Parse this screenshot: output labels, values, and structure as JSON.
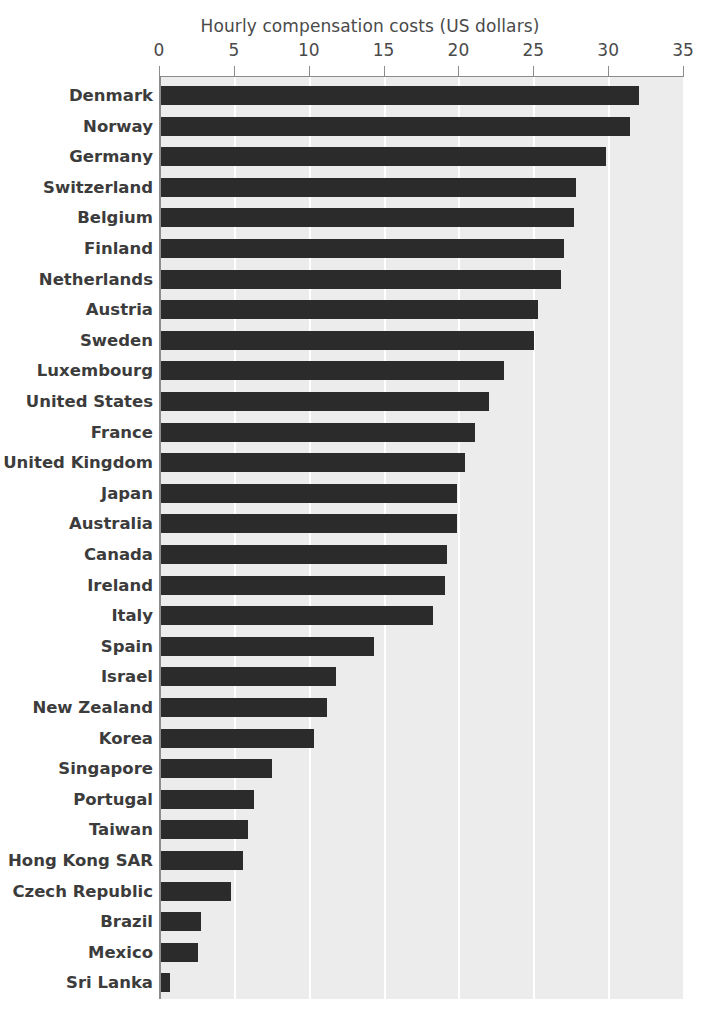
{
  "chart_data": {
    "type": "bar",
    "orientation": "horizontal",
    "title": "Hourly compensation costs (US dollars)",
    "xlabel": "",
    "ylabel": "",
    "xlim": [
      0,
      35
    ],
    "xticks": [
      0,
      5,
      10,
      15,
      20,
      25,
      30,
      35
    ],
    "xtick_labels": [
      "0",
      "5",
      "10",
      "15",
      "20",
      "25",
      "30",
      "35"
    ],
    "grid": true,
    "grid_axis": "x",
    "legend": false,
    "bar_color": "#2b2b2b",
    "plot_background": "#ececec",
    "gridline_color": "#ffffff",
    "axis_color": "#8c8c8c",
    "categories": [
      "Denmark",
      "Norway",
      "Germany",
      "Switzerland",
      "Belgium",
      "Finland",
      "Netherlands",
      "Austria",
      "Sweden",
      "Luxembourg",
      "United States",
      "France",
      "United Kingdom",
      "Japan",
      "Australia",
      "Canada",
      "Ireland",
      "Italy",
      "Spain",
      "Israel",
      "New Zealand",
      "Korea",
      "Singapore",
      "Portugal",
      "Taiwan",
      "Hong Kong SAR",
      "Czech Republic",
      "Brazil",
      "Mexico",
      "Sri Lanka"
    ],
    "values": [
      31.9,
      31.3,
      29.7,
      27.7,
      27.6,
      26.9,
      26.7,
      25.2,
      24.9,
      22.9,
      21.9,
      21.0,
      20.3,
      19.8,
      19.8,
      19.1,
      19.0,
      18.2,
      14.2,
      11.7,
      11.1,
      10.2,
      7.4,
      6.2,
      5.8,
      5.5,
      4.7,
      2.7,
      2.5,
      0.6
    ]
  }
}
